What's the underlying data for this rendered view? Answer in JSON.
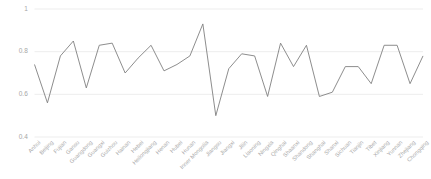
{
  "chart_data": {
    "type": "line",
    "title": "",
    "subtitle": "",
    "xlabel": "",
    "ylabel": "",
    "ylim": [
      0.4,
      1.0
    ],
    "yticks": [
      0.4,
      0.6,
      0.8,
      1
    ],
    "ytick_labels": [
      "0.4",
      "0.6",
      "0.8",
      "1"
    ],
    "grid": true,
    "grid_axis": "y",
    "legend": false,
    "legend_position": "none",
    "line_color": "#808080",
    "grid_color": "#e8e8e8",
    "categories": [
      "Anhui",
      "Beijing",
      "Fujian",
      "Gansu",
      "Guangdong",
      "Guangxi",
      "Guizhou",
      "Hainan",
      "Hebei",
      "Heilongjiang",
      "Henan",
      "Hubei",
      "Hunan",
      "Inner Mongolia",
      "Jiangsu",
      "Jiangxi",
      "Jilin",
      "Liaoning",
      "Ningxia",
      "Qinghai",
      "Shaanxi",
      "Shandong",
      "Shanghai",
      "Shanxi",
      "Sichuan",
      "Tianjin",
      "Tibet",
      "Xinjiang",
      "Yunnan",
      "Zhejiang",
      "Chongqing"
    ],
    "values": [
      0.74,
      0.56,
      0.78,
      0.85,
      0.63,
      0.83,
      0.84,
      0.7,
      0.77,
      0.83,
      0.71,
      0.74,
      0.78,
      0.93,
      0.5,
      0.72,
      0.79,
      0.78,
      0.59,
      0.84,
      0.73,
      0.83,
      0.59,
      0.61,
      0.73,
      0.73,
      0.65,
      0.83,
      0.83,
      0.65,
      0.78
    ]
  }
}
